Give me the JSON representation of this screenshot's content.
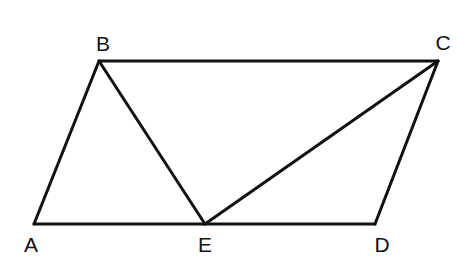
{
  "figure": {
    "type": "geometry-diagram",
    "line_color": "#111111",
    "background_color": "#ffffff"
  },
  "points": [
    {
      "id": "A",
      "label": "A"
    },
    {
      "id": "B",
      "label": "B"
    },
    {
      "id": "C",
      "label": "C"
    },
    {
      "id": "D",
      "label": "D"
    },
    {
      "id": "E",
      "label": "E"
    }
  ],
  "segments": [
    {
      "id": "AB",
      "from": "A",
      "to": "B"
    },
    {
      "id": "BC",
      "from": "B",
      "to": "C"
    },
    {
      "id": "CD",
      "from": "C",
      "to": "D"
    },
    {
      "id": "AE",
      "from": "A",
      "to": "E"
    },
    {
      "id": "ED",
      "from": "E",
      "to": "D"
    },
    {
      "id": "BE",
      "from": "B",
      "to": "E"
    },
    {
      "id": "CE",
      "from": "C",
      "to": "E"
    }
  ]
}
